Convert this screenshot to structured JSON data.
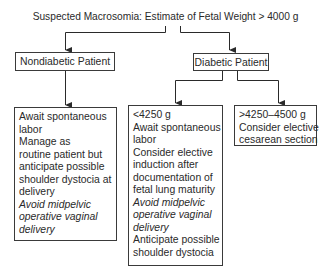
{
  "title": "Suspected Macrosomia: Estimate of Fetal Weight > 4000 g",
  "nodes": {
    "nondiabetic": {
      "label": "Nondiabetic Patient",
      "management": {
        "lines": [
          {
            "text": "Await spontaneous",
            "italic": false
          },
          {
            "text": "labor",
            "italic": false
          },
          {
            "text": "Manage as",
            "italic": false
          },
          {
            "text": "routine patient but",
            "italic": false
          },
          {
            "text": "anticipate possible",
            "italic": false
          },
          {
            "text": "shoulder dystocia at",
            "italic": false
          },
          {
            "text": "delivery",
            "italic": false
          },
          {
            "text": "Avoid midpelvic",
            "italic": true
          },
          {
            "text": "operative vaginal",
            "italic": true
          },
          {
            "text": "delivery",
            "italic": true
          }
        ]
      }
    },
    "diabetic": {
      "label": "Diabetic Patient",
      "under_4250": {
        "lines": [
          {
            "text": "<4250 g",
            "italic": false
          },
          {
            "text": "Await spontaneous",
            "italic": false
          },
          {
            "text": "labor",
            "italic": false
          },
          {
            "text": "Consider elective",
            "italic": false
          },
          {
            "text": "induction after",
            "italic": false
          },
          {
            "text": "documentation of",
            "italic": false
          },
          {
            "text": "fetal lung maturity",
            "italic": false
          },
          {
            "text": "Avoid midpelvic",
            "italic": true
          },
          {
            "text": "operative vaginal",
            "italic": true
          },
          {
            "text": "delivery",
            "italic": true
          },
          {
            "text": "Anticipate possible",
            "italic": false
          },
          {
            "text": "shoulder dystocia",
            "italic": false
          }
        ]
      },
      "over_4250": {
        "lines": [
          {
            "text": ">4250–4500 g",
            "italic": false
          },
          {
            "text": "Consider elective",
            "italic": false
          },
          {
            "text": "cesarean section",
            "italic": false
          }
        ]
      }
    }
  },
  "colors": {
    "line": "#2a2a2a",
    "box_border": "#3a3a3a",
    "text": "#2a2a2a",
    "background": "#ffffff"
  }
}
